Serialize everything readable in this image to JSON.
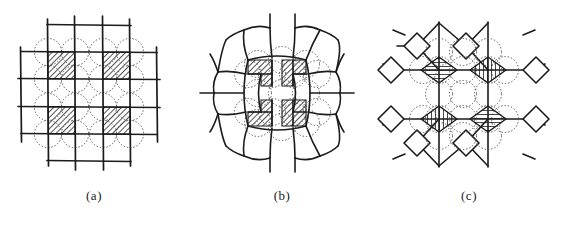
{
  "figure": {
    "background_color": "#ffffff",
    "ink_color": "#1b1b1b",
    "dotted_color": "#555555",
    "panels": [
      {
        "id": "a",
        "caption": "(a)",
        "lattice_type": "square",
        "description": "undistorted square grid with dotted circles at lattice sites and four hatched square cells",
        "grid_lines_vertical": 5,
        "grid_lines_horizontal": 5,
        "hatched_cells": 4,
        "hatch_direction": "diagonal-45",
        "circle_rows": 5,
        "circle_cols": 5
      },
      {
        "id": "b",
        "caption": "(b)",
        "lattice_type": "relaxed-distorted",
        "description": "distorted lattice with cells bulged outward away from centre and four hatched cells",
        "hatched_cells": 4,
        "hatch_direction": "diagonal-45",
        "circle_rows": 4,
        "circle_cols": 4
      },
      {
        "id": "c",
        "caption": "(c)",
        "lattice_type": "diamond-node",
        "description": "diamond shaped nodes joined by straight bonds with four hatched diamonds at centre",
        "hatched_cells": 4,
        "hatch_directions": [
          "horizontal",
          "vertical",
          "vertical",
          "horizontal"
        ],
        "circle_rows": 4,
        "circle_cols": 4
      }
    ]
  }
}
